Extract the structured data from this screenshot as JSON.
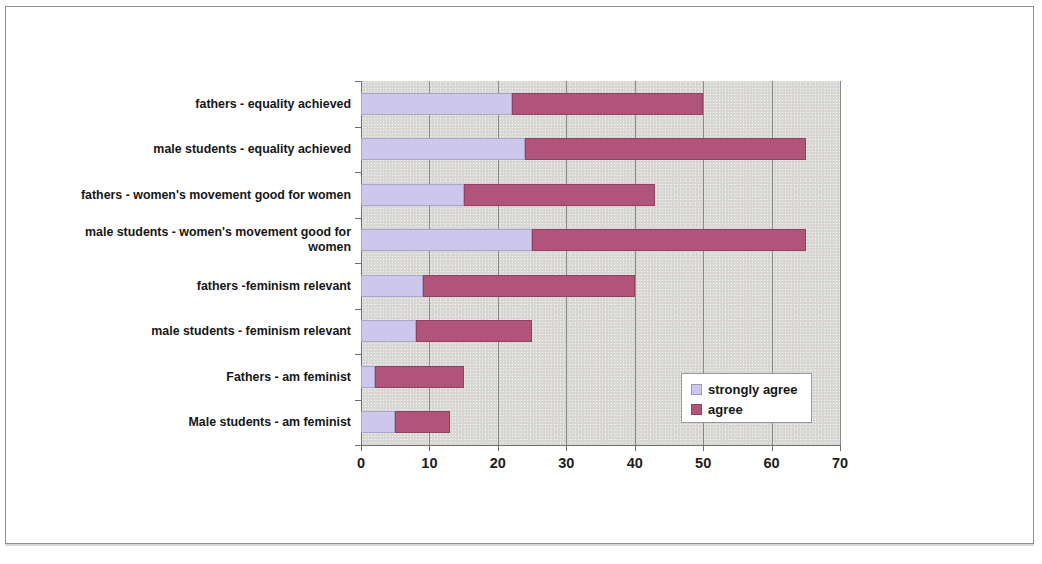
{
  "chart_data": {
    "type": "bar",
    "orientation": "horizontal",
    "stacked": true,
    "title": "",
    "xlabel": "",
    "ylabel": "",
    "xlim": [
      0,
      70
    ],
    "xticks": [
      0,
      10,
      20,
      30,
      40,
      50,
      60,
      70
    ],
    "grid": true,
    "legend_position": "inside-bottom-right",
    "categories": [
      "fathers - equality achieved",
      "male students - equality achieved",
      "fathers - women's movement good for women",
      "male students - women's movement good for women",
      "fathers -feminism relevant",
      "male students - feminism relevant",
      "Fathers - am feminist",
      "Male students - am feminist"
    ],
    "series": [
      {
        "name": "strongly agree",
        "color": "#cdc7ec",
        "values": [
          22,
          24,
          15,
          25,
          9,
          8,
          2,
          5
        ]
      },
      {
        "name": "agree",
        "color": "#b0547a",
        "values": [
          28,
          41,
          28,
          40,
          31,
          17,
          13,
          8
        ]
      }
    ],
    "totals": [
      50,
      65,
      43,
      65,
      40,
      25,
      15,
      13
    ]
  },
  "legend": {
    "items": [
      {
        "label": "strongly agree"
      },
      {
        "label": "agree"
      }
    ]
  },
  "axis": {
    "x_tick_labels": [
      "0",
      "10",
      "20",
      "30",
      "40",
      "50",
      "60",
      "70"
    ]
  },
  "colors": {
    "strongly_agree": "#cdc7ec",
    "agree": "#b0547a",
    "plot_background": "#d7d6d2",
    "gridline": "#8a8a8a"
  }
}
